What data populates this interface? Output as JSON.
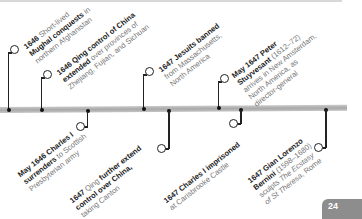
{
  "timeline": {
    "events_above": [
      {
        "year": "1646",
        "bold": "Mughal conquests",
        "lines": [
          "1646 Short-lived",
          "Mughal conquests in",
          "northern Afghanistan"
        ]
      },
      {
        "year": "1646",
        "lines": [
          "1646 Qing control of China",
          "extended over provinces of",
          "Zhejiang, Fujian, and Sichuan"
        ]
      },
      {
        "year": "1647",
        "lines": [
          "1647 Jesuits banned",
          "from Massachusetts,",
          "North America"
        ]
      },
      {
        "year": "May 1647",
        "lines": [
          "May 1647 Peter",
          "Stuyvesant (1612–72)",
          "arrives in New Amsterdam,",
          "North America, as",
          "director-general"
        ]
      }
    ],
    "events_below": [
      {
        "year": "May 1646",
        "lines": [
          "May 1646 Charles I",
          "surrenders to Scottish",
          "Presbyterian army"
        ]
      },
      {
        "year": "1647",
        "lines": [
          "1647 Qing further extend",
          "control over China,",
          "taking Canton"
        ]
      },
      {
        "year": "1647",
        "lines": [
          "1647 Charles I imprisoned",
          "at Carisbrooke Castle"
        ]
      },
      {
        "year": "1647",
        "lines": [
          "1647 Gian Lorenzo",
          "Bernini (1598–1680)",
          "sculpts The Ecstasy",
          "of St Theresa, Rome"
        ]
      }
    ]
  },
  "e1": {
    "y": "1646",
    "a": " Short-lived",
    "b": "Mughal conquests",
    "c": " in",
    "d": "northern Afghanistan"
  },
  "e2": {
    "y": "1646",
    "a": " Qing control of China",
    "b": "extended",
    "c": " over provinces of",
    "d": "Zhejiang, Fujian, and Sichuan"
  },
  "e3": {
    "y": "1647",
    "a": " Jesuits banned",
    "b": "from Massachusetts,",
    "c": "North America"
  },
  "e4": {
    "y": "May 1647",
    "a": " Peter",
    "b": "Stuyvesant",
    "c": " (1612–72)",
    "d": "arrives in New Amsterdam,",
    "e": "North America, as",
    "f": "director-general"
  },
  "e5": {
    "y": "May 1646",
    "a": " Charles I",
    "b": "surrenders",
    "c": " to Scottish",
    "d": "Presbyterian army"
  },
  "e6": {
    "y": "1647",
    "a": " Qing",
    "b": " further extend",
    "c": "control over China,",
    "d": "taking Canton"
  },
  "e7": {
    "y": "1647",
    "a": " Charles I",
    "b": " imprisoned",
    "c": "at Carisbrooke Castle"
  },
  "e8": {
    "y": "1647",
    "a": " Gian Lorenzo",
    "b": "Bernini",
    "c": " (1598–1680)",
    "d": "sculpts ",
    "e": "The Ecstasy",
    "f": "of St Theresa",
    "g": ", Rome"
  },
  "page": {
    "number": "24"
  }
}
